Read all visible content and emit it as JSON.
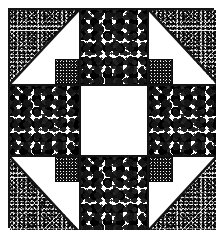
{
  "figure": {
    "kind": "quilt-block-line-drawing",
    "width": 223,
    "height": 236,
    "background_color": "#ffffff",
    "outline_color": "#141414",
    "grid": {
      "rows": 3,
      "columns": 3,
      "description": "Three-by-three patchwork block with half-square-triangle corners, speckled edge squares and a plain center square."
    }
  },
  "textures": {
    "speckle": {
      "name": "medium-speckle",
      "color": "#151515",
      "base": "#fdfdfd"
    },
    "stipple": {
      "name": "coarse-stipple",
      "color": "#0a0a0a",
      "base": "#f7f7f7"
    },
    "dense": {
      "name": "dense-black-stipple",
      "color": "#000000",
      "base": "#1a1a1a"
    },
    "plain": {
      "name": "plain-white",
      "color": "#ffffff",
      "base": "#ffffff"
    }
  },
  "patches": [
    {
      "id": "top-left",
      "position": "row-1 col-1",
      "shape": "half-square-triangle",
      "fill": "stipple",
      "triangle_half": "top-left",
      "background": "plain",
      "corner_square": {
        "present": true,
        "corner": "bottom-right",
        "fill": "dense"
      }
    },
    {
      "id": "top-center",
      "position": "row-1 col-2",
      "shape": "square",
      "fill": "speckle",
      "triangle_half": null,
      "background": "speckle",
      "corner_square": {
        "present": false,
        "corner": null,
        "fill": null
      }
    },
    {
      "id": "top-right",
      "position": "row-1 col-3",
      "shape": "half-square-triangle",
      "fill": "stipple",
      "triangle_half": "top-right",
      "background": "plain",
      "corner_square": {
        "present": true,
        "corner": "bottom-left",
        "fill": "dense"
      }
    },
    {
      "id": "middle-left",
      "position": "row-2 col-1",
      "shape": "square",
      "fill": "speckle",
      "triangle_half": null,
      "background": "speckle",
      "corner_square": {
        "present": false,
        "corner": null,
        "fill": null
      }
    },
    {
      "id": "center",
      "position": "row-2 col-2",
      "shape": "square",
      "fill": "plain",
      "triangle_half": null,
      "background": "plain",
      "corner_square": {
        "present": false,
        "corner": null,
        "fill": null
      }
    },
    {
      "id": "middle-right",
      "position": "row-2 col-3",
      "shape": "square",
      "fill": "speckle",
      "triangle_half": null,
      "background": "speckle",
      "corner_square": {
        "present": false,
        "corner": null,
        "fill": null
      }
    },
    {
      "id": "bottom-left",
      "position": "row-3 col-1",
      "shape": "half-square-triangle",
      "fill": "stipple",
      "triangle_half": "bottom-left",
      "background": "plain",
      "corner_square": {
        "present": true,
        "corner": "top-right",
        "fill": "dense"
      }
    },
    {
      "id": "bottom-center",
      "position": "row-3 col-2",
      "shape": "square",
      "fill": "speckle",
      "triangle_half": null,
      "background": "speckle",
      "corner_square": {
        "present": false,
        "corner": null,
        "fill": null
      }
    },
    {
      "id": "bottom-right",
      "position": "row-3 col-3",
      "shape": "half-square-triangle",
      "fill": "stipple",
      "triangle_half": "bottom-right",
      "background": "plain",
      "corner_square": {
        "present": true,
        "corner": "top-left",
        "fill": "dense"
      }
    }
  ],
  "artifacts": [
    {
      "id": "ink-smudge",
      "description": "small stray ink mark inside the bottom-left triangle"
    }
  ]
}
